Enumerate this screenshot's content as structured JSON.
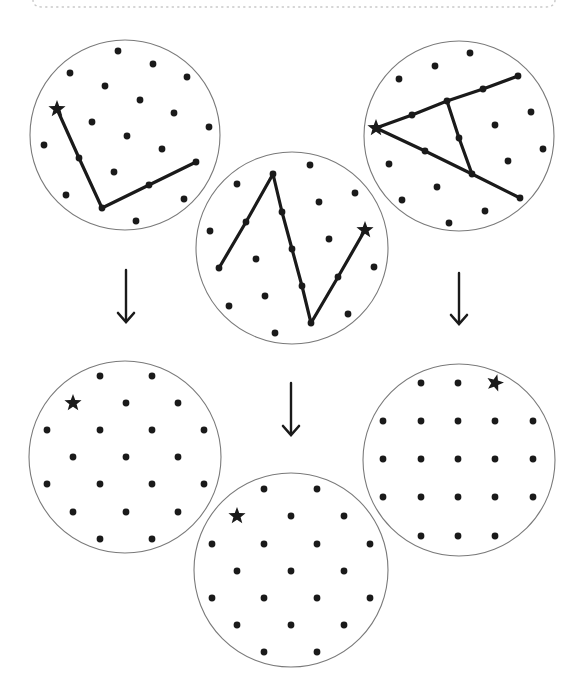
{
  "colors": {
    "ink": "#1a1a1a",
    "circle_stroke": "#7a7a7a",
    "border_dots": "#c8c8c8",
    "background": "#ffffff"
  },
  "border": {
    "style": "dotted",
    "y": 7,
    "x1": 35,
    "x2": 553
  },
  "panels": [
    {
      "id": "top-left",
      "role": "pattern",
      "center": [
        125,
        135
      ],
      "radius": 95,
      "star": [
        57,
        109
      ],
      "dots": [
        [
          118,
          51
        ],
        [
          153,
          64
        ],
        [
          70,
          73
        ],
        [
          187,
          77
        ],
        [
          105,
          86
        ],
        [
          140,
          100
        ],
        [
          174,
          113
        ],
        [
          92,
          122
        ],
        [
          209,
          127
        ],
        [
          127,
          136
        ],
        [
          44,
          145
        ],
        [
          162,
          149
        ],
        [
          79,
          158
        ],
        [
          114,
          172
        ],
        [
          196,
          162
        ],
        [
          149,
          185
        ],
        [
          66,
          195
        ],
        [
          184,
          199
        ],
        [
          102,
          208
        ],
        [
          136,
          221
        ]
      ],
      "path": [
        [
          57,
          109
        ],
        [
          79,
          158
        ],
        [
          102,
          208
        ],
        [
          149,
          185
        ],
        [
          196,
          162
        ]
      ]
    },
    {
      "id": "top-middle",
      "role": "pattern",
      "center": [
        292,
        248
      ],
      "radius": 96,
      "star": [
        365,
        230
      ],
      "dots": [
        [
          310,
          165
        ],
        [
          273,
          174
        ],
        [
          237,
          184
        ],
        [
          355,
          193
        ],
        [
          319,
          202
        ],
        [
          282,
          212
        ],
        [
          246,
          222
        ],
        [
          210,
          231
        ],
        [
          329,
          239
        ],
        [
          292,
          249
        ],
        [
          256,
          259
        ],
        [
          219,
          268
        ],
        [
          374,
          267
        ],
        [
          338,
          277
        ],
        [
          302,
          286
        ],
        [
          265,
          296
        ],
        [
          229,
          306
        ],
        [
          348,
          314
        ],
        [
          311,
          323
        ],
        [
          275,
          333
        ]
      ],
      "path": [
        [
          219,
          268
        ],
        [
          246,
          222
        ],
        [
          273,
          174
        ],
        [
          282,
          212
        ],
        [
          292,
          249
        ],
        [
          302,
          286
        ],
        [
          311,
          323
        ],
        [
          338,
          277
        ],
        [
          365,
          230
        ]
      ]
    },
    {
      "id": "top-right",
      "role": "pattern",
      "center": [
        459,
        136
      ],
      "radius": 95,
      "star": [
        376,
        128
      ],
      "dots": [
        [
          470,
          53
        ],
        [
          435,
          66
        ],
        [
          399,
          79
        ],
        [
          518,
          76
        ],
        [
          483,
          89
        ],
        [
          447,
          101
        ],
        [
          412,
          115
        ],
        [
          531,
          112
        ],
        [
          495,
          125
        ],
        [
          459,
          138
        ],
        [
          543,
          149
        ],
        [
          425,
          151
        ],
        [
          389,
          164
        ],
        [
          508,
          161
        ],
        [
          472,
          174
        ],
        [
          437,
          187
        ],
        [
          520,
          198
        ],
        [
          402,
          200
        ],
        [
          485,
          211
        ],
        [
          449,
          223
        ]
      ],
      "paths": [
        [
          [
            376,
            128
          ],
          [
            412,
            115
          ],
          [
            447,
            101
          ],
          [
            483,
            89
          ],
          [
            518,
            76
          ]
        ],
        [
          [
            376,
            128
          ],
          [
            425,
            151
          ],
          [
            472,
            174
          ],
          [
            520,
            198
          ]
        ],
        [
          [
            447,
            101
          ],
          [
            459,
            138
          ],
          [
            472,
            174
          ]
        ]
      ]
    },
    {
      "id": "bottom-left",
      "role": "grid",
      "center": [
        125,
        457
      ],
      "radius": 96,
      "star": [
        73,
        403
      ],
      "dots": [
        [
          100,
          376
        ],
        [
          152,
          376
        ],
        [
          126,
          403
        ],
        [
          178,
          403
        ],
        [
          47,
          430
        ],
        [
          100,
          430
        ],
        [
          152,
          430
        ],
        [
          204,
          430
        ],
        [
          73,
          457
        ],
        [
          126,
          457
        ],
        [
          178,
          457
        ],
        [
          47,
          484
        ],
        [
          100,
          484
        ],
        [
          152,
          484
        ],
        [
          204,
          484
        ],
        [
          73,
          512
        ],
        [
          126,
          512
        ],
        [
          178,
          512
        ],
        [
          100,
          539
        ],
        [
          152,
          539
        ]
      ]
    },
    {
      "id": "bottom-middle",
      "role": "grid",
      "center": [
        291,
        570
      ],
      "radius": 97,
      "star": [
        237,
        516
      ],
      "dots": [
        [
          264,
          489
        ],
        [
          317,
          489
        ],
        [
          291,
          516
        ],
        [
          344,
          516
        ],
        [
          212,
          544
        ],
        [
          264,
          544
        ],
        [
          317,
          544
        ],
        [
          370,
          544
        ],
        [
          237,
          571
        ],
        [
          291,
          571
        ],
        [
          344,
          571
        ],
        [
          212,
          598
        ],
        [
          264,
          598
        ],
        [
          317,
          598
        ],
        [
          370,
          598
        ],
        [
          237,
          625
        ],
        [
          291,
          625
        ],
        [
          344,
          625
        ],
        [
          264,
          652
        ],
        [
          317,
          652
        ]
      ]
    },
    {
      "id": "bottom-right",
      "role": "grid",
      "center": [
        459,
        460
      ],
      "radius": 96,
      "star": [
        495,
        383
      ],
      "star_rotation": 15,
      "dots": [
        [
          421,
          383
        ],
        [
          458,
          383
        ],
        [
          383,
          421
        ],
        [
          421,
          421
        ],
        [
          458,
          421
        ],
        [
          495,
          421
        ],
        [
          533,
          421
        ],
        [
          383,
          459
        ],
        [
          421,
          459
        ],
        [
          458,
          459
        ],
        [
          495,
          459
        ],
        [
          533,
          459
        ],
        [
          383,
          497
        ],
        [
          421,
          497
        ],
        [
          458,
          497
        ],
        [
          495,
          497
        ],
        [
          533,
          497
        ],
        [
          421,
          536
        ],
        [
          458,
          536
        ],
        [
          495,
          536
        ]
      ]
    }
  ],
  "arrows": [
    {
      "id": "arrow-left",
      "x": 126,
      "y1": 270,
      "y2": 322,
      "direction": "down"
    },
    {
      "id": "arrow-middle",
      "x": 291,
      "y1": 383,
      "y2": 435,
      "direction": "down"
    },
    {
      "id": "arrow-right",
      "x": 459,
      "y1": 273,
      "y2": 324,
      "direction": "down"
    }
  ]
}
